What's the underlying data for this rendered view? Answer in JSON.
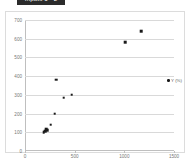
{
  "title_bar": {
    "text": "Inputs 1 - 2"
  },
  "legend": {
    "position": "right",
    "marker_icon": "dot-marker-icon",
    "entries": [
      "Y (%)"
    ]
  },
  "chart_data": {
    "type": "scatter",
    "title": "",
    "subtitle": "",
    "xlabel": "",
    "ylabel": "",
    "xlim": [
      0,
      1500
    ],
    "ylim": [
      0,
      700
    ],
    "grid": true,
    "legend_position": "right",
    "xticks": [
      0,
      500,
      1000,
      1500
    ],
    "yticks": [
      0,
      100,
      200,
      300,
      400,
      500,
      600,
      700
    ],
    "series": [
      {
        "name": "Y (%)",
        "marker": "square",
        "color": "#1a1a1a",
        "points": [
          {
            "x": 190,
            "y": 100
          },
          {
            "x": 205,
            "y": 105
          },
          {
            "x": 215,
            "y": 118
          },
          {
            "x": 225,
            "y": 112
          },
          {
            "x": 260,
            "y": 140
          },
          {
            "x": 300,
            "y": 200
          },
          {
            "x": 315,
            "y": 380
          },
          {
            "x": 390,
            "y": 285
          },
          {
            "x": 470,
            "y": 300
          },
          {
            "x": 1010,
            "y": 580
          },
          {
            "x": 1170,
            "y": 640
          }
        ]
      }
    ]
  }
}
